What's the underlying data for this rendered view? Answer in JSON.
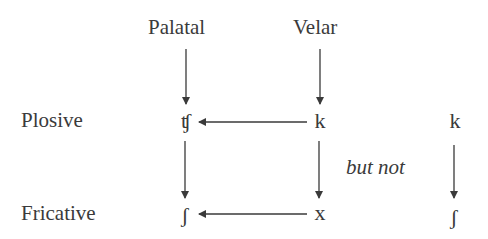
{
  "columns": {
    "palatal": "Palatal",
    "velar": "Velar"
  },
  "rows": {
    "plosive": "Plosive",
    "fricative": "Fricative"
  },
  "symbols": {
    "palatal_plosive": "ʧ",
    "velar_plosive": "k",
    "palatal_fricative": "ʃ",
    "velar_fricative": "x",
    "contrast_top": "k",
    "contrast_bottom": "ʃ"
  },
  "contrast_label": "but not",
  "arrows": [
    {
      "from": "Palatal",
      "to": "ʧ",
      "direction": "down"
    },
    {
      "from": "Velar",
      "to": "k",
      "direction": "down"
    },
    {
      "from": "k",
      "to": "ʧ",
      "direction": "left"
    },
    {
      "from": "ʧ",
      "to": "ʃ",
      "direction": "down"
    },
    {
      "from": "k",
      "to": "x",
      "direction": "down"
    },
    {
      "from": "x",
      "to": "ʃ",
      "direction": "left"
    },
    {
      "from": "k",
      "to": "ʃ",
      "direction": "down",
      "note": "not attested"
    }
  ],
  "colors": {
    "ink": "#3a3a3a",
    "background": "#ffffff"
  }
}
